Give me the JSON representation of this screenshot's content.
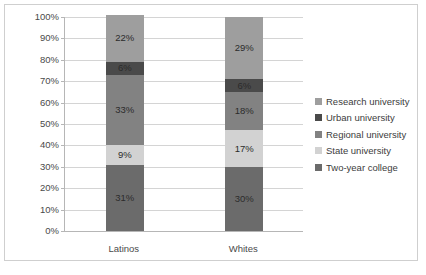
{
  "chart_data": {
    "type": "bar",
    "stacked": true,
    "stack_mode": "percent",
    "title": "",
    "xlabel": "",
    "ylabel": "",
    "categories": [
      "Latinos",
      "Whites"
    ],
    "ylim": [
      0,
      100
    ],
    "ytick_labels": [
      "0%",
      "10%",
      "20%",
      "30%",
      "40%",
      "50%",
      "60%",
      "70%",
      "80%",
      "90%",
      "100%"
    ],
    "ytick_values": [
      0,
      10,
      20,
      30,
      40,
      50,
      60,
      70,
      80,
      90,
      100
    ],
    "grid": true,
    "legend_position": "right",
    "series": [
      {
        "name": "Two-year college",
        "color": "#6b6b6b",
        "values": [
          31,
          30
        ],
        "labels": [
          "31%",
          "30%"
        ]
      },
      {
        "name": "State university",
        "color": "#d2d2d2",
        "values": [
          9,
          17
        ],
        "labels": [
          "9%",
          "17%"
        ]
      },
      {
        "name": "Regional university",
        "color": "#828282",
        "values": [
          33,
          18
        ],
        "labels": [
          "33%",
          "18%"
        ]
      },
      {
        "name": "Urban university",
        "color": "#4a4a4a",
        "values": [
          6,
          6
        ],
        "labels": [
          "6%",
          "6%"
        ]
      },
      {
        "name": "Research university",
        "color": "#9e9e9e",
        "values": [
          22,
          29
        ],
        "labels": [
          "22%",
          "29%"
        ]
      }
    ],
    "legend_entries": [
      {
        "label": "Research university",
        "color": "#9e9e9e"
      },
      {
        "label": "Urban university",
        "color": "#4a4a4a"
      },
      {
        "label": "Regional university",
        "color": "#828282"
      },
      {
        "label": "State university",
        "color": "#d2d2d2"
      },
      {
        "label": "Two-year college",
        "color": "#6b6b6b"
      }
    ]
  }
}
